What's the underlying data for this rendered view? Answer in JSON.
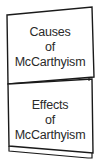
{
  "flaps": [
    {
      "lines": [
        "Causes",
        "of",
        "McCarthyism"
      ]
    },
    {
      "lines": [
        "Effects",
        "of",
        "McCarthyism"
      ]
    }
  ],
  "colors": {
    "stroke": "#1a1a1a",
    "text": "#2a2a2a",
    "background": "#ffffff"
  }
}
